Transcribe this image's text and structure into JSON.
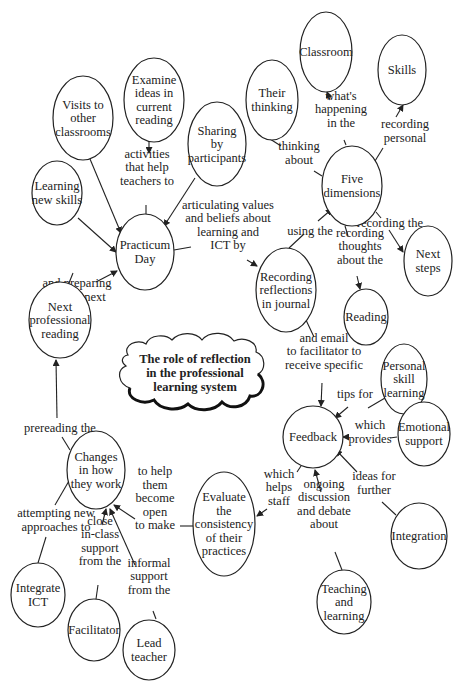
{
  "diagram": {
    "title": "The role of reflection in the professional learning system",
    "title_lines": [
      "The role of reflection",
      "in the professional",
      "learning system"
    ],
    "nodes": [
      {
        "id": "classroom",
        "lines": [
          "Classroom"
        ],
        "cx": 326,
        "cy": 52,
        "rx": 26,
        "ry": 40
      },
      {
        "id": "skills",
        "lines": [
          "Skills"
        ],
        "cx": 402,
        "cy": 70,
        "rx": 24,
        "ry": 35
      },
      {
        "id": "their_thinking",
        "lines": [
          "Their",
          "thinking"
        ],
        "cx": 272,
        "cy": 100,
        "rx": 26,
        "ry": 40
      },
      {
        "id": "examine_ideas",
        "lines": [
          "Examine",
          "ideas in",
          "current",
          "reading"
        ],
        "cx": 154,
        "cy": 100,
        "rx": 30,
        "ry": 42
      },
      {
        "id": "visits",
        "lines": [
          "Visits to",
          "other",
          "classrooms"
        ],
        "cx": 83,
        "cy": 118,
        "rx": 30,
        "ry": 42
      },
      {
        "id": "sharing",
        "lines": [
          "Sharing",
          "by",
          "participants"
        ],
        "cx": 217,
        "cy": 144,
        "rx": 29,
        "ry": 42
      },
      {
        "id": "learning_new_skills",
        "lines": [
          "Learning",
          "new skills"
        ],
        "cx": 57,
        "cy": 193,
        "rx": 25,
        "ry": 32
      },
      {
        "id": "five_dimensions",
        "lines": [
          "Five",
          "dimensions"
        ],
        "cx": 352,
        "cy": 186,
        "rx": 30,
        "ry": 40
      },
      {
        "id": "practicum_day",
        "lines": [
          "Practicum",
          "Day"
        ],
        "cx": 145,
        "cy": 252,
        "rx": 29,
        "ry": 38
      },
      {
        "id": "recording_reflections",
        "lines": [
          "Recording",
          "reflections",
          "in journal"
        ],
        "cx": 286,
        "cy": 290,
        "rx": 30,
        "ry": 42
      },
      {
        "id": "next_steps",
        "lines": [
          "Next",
          "steps"
        ],
        "cx": 428,
        "cy": 261,
        "rx": 24,
        "ry": 35
      },
      {
        "id": "reading",
        "lines": [
          "Reading"
        ],
        "cx": 366,
        "cy": 317,
        "rx": 22,
        "ry": 28
      },
      {
        "id": "next_professional_reading",
        "lines": [
          "Next",
          "professional",
          "reading"
        ],
        "cx": 60,
        "cy": 320,
        "rx": 31,
        "ry": 38
      },
      {
        "id": "personal_skill_learning",
        "lines": [
          "Personal",
          "skill",
          "learning"
        ],
        "cx": 404,
        "cy": 379,
        "rx": 23,
        "ry": 35
      },
      {
        "id": "feedback",
        "lines": [
          "Feedback"
        ],
        "cx": 313,
        "cy": 437,
        "rx": 30,
        "ry": 31
      },
      {
        "id": "emotional_support",
        "lines": [
          "Emotional",
          "support"
        ],
        "cx": 424,
        "cy": 434,
        "rx": 26,
        "ry": 32
      },
      {
        "id": "changes",
        "lines": [
          "Changes",
          "in how",
          "they work"
        ],
        "cx": 96,
        "cy": 470,
        "rx": 29,
        "ry": 39
      },
      {
        "id": "evaluate",
        "lines": [
          "Evaluate",
          "the",
          "consistency",
          "of their",
          "practices"
        ],
        "cx": 224,
        "cy": 524,
        "rx": 31,
        "ry": 52
      },
      {
        "id": "integration",
        "lines": [
          "Integration"
        ],
        "cx": 419,
        "cy": 536,
        "rx": 28,
        "ry": 33
      },
      {
        "id": "integrate_ict",
        "lines": [
          "Integrate",
          "ICT"
        ],
        "cx": 38,
        "cy": 595,
        "rx": 27,
        "ry": 32
      },
      {
        "id": "facilitator",
        "lines": [
          "Facilitator"
        ],
        "cx": 94,
        "cy": 630,
        "rx": 26,
        "ry": 31
      },
      {
        "id": "lead_teacher",
        "lines": [
          "Lead",
          "teacher"
        ],
        "cx": 149,
        "cy": 650,
        "rx": 26,
        "ry": 30
      },
      {
        "id": "teaching_learning",
        "lines": [
          "Teaching",
          "and",
          "learning"
        ],
        "cx": 344,
        "cy": 602,
        "rx": 27,
        "ry": 32
      }
    ],
    "edges": [
      {
        "from": "visits",
        "to": "practicum_day",
        "label": [],
        "line": [
          [
            90,
            159
          ],
          [
            121,
            233
          ]
        ],
        "arrow": true
      },
      {
        "from": "examine_ideas",
        "to": "practicum_day",
        "label": [
          "activities",
          "that help",
          "teachers to"
        ],
        "label_x": 147,
        "label_y": 167,
        "line": [
          [
            146,
            205
          ],
          [
            146,
            214
          ]
        ],
        "line2": [
          [
            149,
            142
          ],
          [
            149,
            153
          ]
        ],
        "arrow": true
      },
      {
        "from": "sharing",
        "to": "practicum_day",
        "label": [],
        "line": [
          [
            195,
            178
          ],
          [
            164,
            226
          ]
        ],
        "arrow": true
      },
      {
        "from": "learning_new_skills",
        "to": "practicum_day",
        "label": [],
        "line": [
          [
            78,
            218
          ],
          [
            116,
            252
          ]
        ],
        "arrow": true
      },
      {
        "from": "practicum_day",
        "to": "recording_reflections",
        "label": [
          "articulating values",
          "and beliefs about",
          "learning and",
          "ICT by"
        ],
        "label_x": 228,
        "label_y": 225,
        "line": [
          [
            174,
            250
          ],
          [
            191,
            247
          ]
        ],
        "line2": [
          [
            247,
            260
          ],
          [
            257,
            266
          ]
        ],
        "arrow": true
      },
      {
        "from": "next_professional_reading",
        "to": "practicum_day",
        "label": [
          "and preparing",
          "for the next"
        ],
        "label_x": 77,
        "label_y": 290,
        "line": [
          [
            69,
            283
          ],
          [
            73,
            273
          ]
        ],
        "line2": [
          [
            96,
            282
          ],
          [
            117,
            271
          ]
        ],
        "arrow": true
      },
      {
        "from": "recording_reflections",
        "to": "five_dimensions",
        "label": [
          "using the"
        ],
        "label_x": 310,
        "label_y": 231,
        "line": [
          [
            289,
            248
          ],
          [
            304,
            234
          ]
        ],
        "line2": [
          [
            318,
            221
          ],
          [
            332,
            209
          ]
        ],
        "arrow": true
      },
      {
        "from": "their_thinking",
        "to": "five_dimensions",
        "label": [
          "thinking",
          "about"
        ],
        "label_x": 299,
        "label_y": 153,
        "line": [
          [
            270,
            139
          ],
          [
            281,
            146
          ]
        ],
        "line2": [
          [
            314,
            171
          ],
          [
            322,
            176
          ]
        ],
        "arrow": false
      },
      {
        "from": "five_dimensions",
        "to": "classroom",
        "label": [
          "what's",
          "happening",
          "in the"
        ],
        "label_x": 341,
        "label_y": 109,
        "line": [
          [
            346,
            145
          ],
          [
            344,
            140
          ]
        ],
        "line2": [
          [
            330,
            100
          ],
          [
            327,
            92
          ]
        ],
        "arrow": true
      },
      {
        "from": "five_dimensions",
        "to": "skills",
        "label": [
          "recording",
          "personal"
        ],
        "label_x": 405,
        "label_y": 131,
        "line": [
          [
            375,
            161
          ],
          [
            383,
            148
          ]
        ],
        "line2": [
          [
            396,
            117
          ],
          [
            403,
            105
          ]
        ],
        "arrow": true
      },
      {
        "from": "five_dimensions",
        "to": "next_steps",
        "label": [
          "recording the"
        ],
        "label_x": 390,
        "label_y": 223,
        "line": [
          [
            376,
            212
          ],
          [
            381,
            218
          ]
        ],
        "line2": [
          [
            389,
            230
          ],
          [
            403,
            252
          ]
        ],
        "arrow": true
      },
      {
        "from": "five_dimensions",
        "to": "reading",
        "label": [
          "recording",
          "thoughts",
          "about the"
        ],
        "label_x": 360,
        "label_y": 246,
        "line": [
          [
            345,
            226
          ],
          [
            348,
            236
          ]
        ],
        "line2": [
          [
            357,
            276
          ],
          [
            360,
            289
          ]
        ],
        "arrow": true
      },
      {
        "from": "recording_reflections",
        "to": "feedback",
        "label": [
          "and email",
          "to facilitator to",
          "receive specific"
        ],
        "label_x": 324,
        "label_y": 351,
        "line": [
          [
            306,
            320
          ],
          [
            314,
            337
          ]
        ],
        "line2": [
          [
            322,
            383
          ],
          [
            321,
            406
          ]
        ],
        "arrow": true
      },
      {
        "from": "personal_skill_learning",
        "to": "feedback",
        "label": [
          "tips for"
        ],
        "label_x": 355,
        "label_y": 394,
        "line": [
          [
            385,
            398
          ],
          [
            368,
            408
          ]
        ],
        "line2": [
          [
            348,
            407
          ],
          [
            335,
            418
          ]
        ],
        "arrow": true
      },
      {
        "from": "emotional_support",
        "to": "feedback",
        "label": [
          "which",
          "provides"
        ],
        "label_x": 370,
        "label_y": 432,
        "line": [
          [
            397,
            437
          ],
          [
            390,
            438
          ]
        ],
        "line2": [
          [
            345,
            437
          ],
          [
            343,
            437
          ]
        ],
        "arrow": true
      },
      {
        "from": "integration",
        "to": "feedback",
        "label": [
          "ideas for",
          "further"
        ],
        "label_x": 374,
        "label_y": 483,
        "line": [
          [
            396,
            515
          ],
          [
            382,
            502
          ]
        ],
        "line2": [
          [
            357,
            472
          ],
          [
            336,
            450
          ]
        ],
        "arrow": true
      },
      {
        "from": "teaching_learning",
        "to": "feedback",
        "label": [
          "ongoing",
          "discussion",
          "and debate",
          "about"
        ],
        "label_x": 324,
        "label_y": 504,
        "line": [
          [
            342,
            570
          ],
          [
            335,
            552
          ]
        ],
        "line2": [
          [
            321,
            492
          ],
          [
            315,
            470
          ]
        ],
        "arrow": true
      },
      {
        "from": "feedback",
        "to": "evaluate",
        "label": [
          "which",
          "helps",
          "staff"
        ],
        "label_x": 279,
        "label_y": 487,
        "line": [
          [
            301,
            466
          ],
          [
            297,
            472
          ]
        ],
        "line2": [
          [
            267,
            509
          ],
          [
            257,
            516
          ]
        ],
        "arrow": true
      },
      {
        "from": "evaluate",
        "to": "changes",
        "label": [
          "to help",
          "them",
          "become",
          "open",
          "to make"
        ],
        "label_x": 155,
        "label_y": 498,
        "line": [
          [
            193,
            526
          ],
          [
            180,
            526
          ]
        ],
        "line2": [
          [
            135,
            519
          ],
          [
            114,
            505
          ]
        ],
        "arrow": true
      },
      {
        "from": "changes",
        "to": "next_professional_reading",
        "label": [
          "prereading the"
        ],
        "label_x": 60,
        "label_y": 428,
        "line": [
          [
            70,
            450
          ],
          [
            62,
            437
          ]
        ],
        "line2": [
          [
            57,
            418
          ],
          [
            56,
            360
          ]
        ],
        "arrow": true
      },
      {
        "from": "integrate_ict",
        "to": "changes",
        "label": [
          "attempting new",
          "approaches to"
        ],
        "label_x": 56,
        "label_y": 520,
        "line": [
          [
            38,
            563
          ],
          [
            46,
            537
          ]
        ],
        "line2": [
          [
            55,
            505
          ],
          [
            73,
            474
          ]
        ],
        "arrow": true
      },
      {
        "from": "facilitator",
        "to": "changes",
        "label": [
          "close",
          "in-class",
          "support",
          "from the"
        ],
        "label_x": 100,
        "label_y": 541,
        "line": [
          [
            96,
            599
          ],
          [
            98,
            585
          ]
        ],
        "line2": [
          [
            102,
            525
          ],
          [
            106,
            509
          ]
        ],
        "arrow": true
      },
      {
        "from": "lead_teacher",
        "to": "changes",
        "label": [
          "informal",
          "support",
          "from the"
        ],
        "label_x": 149,
        "label_y": 576,
        "line": [
          [
            156,
            619
          ],
          [
            153,
            611
          ]
        ],
        "line2": [
          [
            135,
            565
          ],
          [
            110,
            509
          ]
        ],
        "arrow": true
      }
    ]
  }
}
